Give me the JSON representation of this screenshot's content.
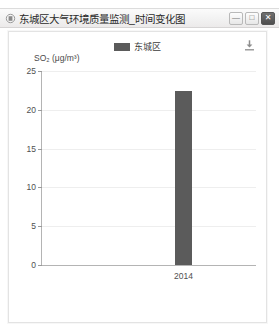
{
  "window": {
    "title": "东城区大气环境质量监测_时间变化图",
    "title_icon": "window-app-icon",
    "controls": {
      "minimize_glyph": "—",
      "maximize_glyph": "□",
      "close_glyph": "✕"
    }
  },
  "toolbar": {
    "download_icon": "download-icon"
  },
  "chart_data": {
    "type": "bar",
    "title": "",
    "subtitle": "",
    "categories": [
      "2014"
    ],
    "values": [
      22.4
    ],
    "series": [
      {
        "name": "东城区",
        "values": [
          22.4
        ],
        "color": "#5b5b5b"
      }
    ],
    "xlabel": "",
    "ylabel": "SO₂ (μg/m³)",
    "ylim": [
      0,
      25
    ],
    "yticks": [
      0,
      5,
      10,
      15,
      20,
      25
    ],
    "ytick_labels": [
      "0",
      "5",
      "10",
      "15",
      "20",
      "25"
    ],
    "xtick_labels": [
      "2014"
    ],
    "grid": true,
    "legend": {
      "position": "top-center",
      "entries": [
        {
          "label": "东城区",
          "color": "#5b5b5b"
        }
      ]
    }
  }
}
